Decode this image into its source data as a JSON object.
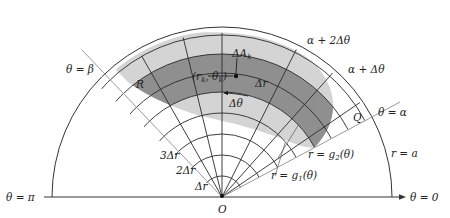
{
  "figure": {
    "type": "polar-region-partition",
    "colors": {
      "background": "#ffffff",
      "region_light": "#d4d4d4",
      "region_dark": "#8f8f8f",
      "grid_line": "#2a2a2a",
      "ray_line": "#9a9a9a",
      "axis": "#333333"
    }
  },
  "labels": {
    "theta_beta": "θ = β",
    "theta_pi": "θ = π",
    "theta_zero": "θ = 0",
    "theta_alpha": "θ = α",
    "alpha_plus_dtheta": "α + Δθ",
    "alpha_plus_2dtheta": "α + 2Δθ",
    "region": "R",
    "point": "(r",
    "point_sub_r": "k",
    "point_mid": ", θ",
    "point_sub_theta": "k",
    "point_close": ")",
    "delta_area": "ΔA",
    "delta_area_sub": "k",
    "delta_r": "Δr",
    "delta_theta": "Δθ",
    "q": "Q",
    "r_eq_a": "r = a",
    "r_g2": "r = g",
    "r_g2_sub": "2",
    "r_g2_arg": "(θ)",
    "r_g1": "r = g",
    "r_g1_sub": "1",
    "r_g1_arg": "(θ)",
    "ring_1": "Δr",
    "ring_2": "2Δr",
    "ring_3": "3Δr",
    "origin": "O"
  }
}
